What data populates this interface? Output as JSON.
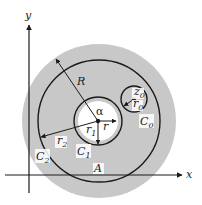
{
  "figure": {
    "colors": {
      "region_fill": "#c8c8c8",
      "inner_fill": "#ffffff",
      "stroke": "#1a1a1a"
    }
  },
  "axes": {
    "x_label": "x",
    "y_label": "y"
  },
  "labels": {
    "R": "R",
    "alpha": "α",
    "r": "r",
    "r1": "r",
    "r1_sub": "1",
    "r2": "r",
    "r2_sub": "2",
    "z0": "z",
    "z0_sub": "0",
    "r0": "r",
    "r0_sub": "0",
    "C0": "C",
    "C0_sub": "0",
    "C1": "C",
    "C1_sub": "1",
    "C2": "C",
    "C2_sub": "2",
    "A": "A"
  }
}
